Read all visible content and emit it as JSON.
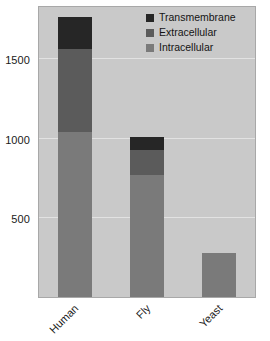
{
  "chart_data": {
    "type": "bar",
    "barmode": "stacked",
    "title": "",
    "subtitle": "",
    "xlabel": "",
    "ylabel": "",
    "categories": [
      "Human",
      "Fly",
      "Yeast"
    ],
    "series": [
      {
        "name": "Intracellular",
        "color": "#7a7a7a",
        "values": [
          1040,
          770,
          280
        ]
      },
      {
        "name": "Extracellular",
        "color": "#5b5b5b",
        "values": [
          525,
          160,
          0
        ]
      },
      {
        "name": "Transmembrane",
        "color": "#262626",
        "values": [
          205,
          80,
          0
        ]
      }
    ],
    "totals": [
      1770,
      1010,
      280
    ],
    "ylim": [
      0,
      1830
    ],
    "yticks": [
      500,
      1000,
      1500
    ],
    "ytick_labels": [
      "500",
      "1000",
      "1500"
    ],
    "grid": true,
    "grid_color": "#e2e2e2",
    "plot_background": "#c9c9c9",
    "figure_background": "#ffffff",
    "legend": {
      "position": "top-right",
      "entries": [
        {
          "label": "Transmembrane",
          "color": "#262626"
        },
        {
          "label": "Extracellular",
          "color": "#5b5b5b"
        },
        {
          "label": "Intracellular",
          "color": "#7a7a7a"
        }
      ]
    },
    "xtick_rotation": -45
  }
}
